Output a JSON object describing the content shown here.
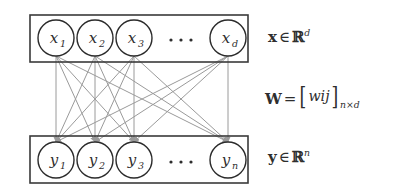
{
  "figure": {
    "type": "bipartite-network-diagram",
    "background_color": "#ffffff",
    "box_stroke_color": "#3a3a3a",
    "node_stroke_color": "#2b2b2b",
    "edge_color": "#9a9a9a",
    "text_color": "#2e2e2e"
  },
  "input_layer": {
    "name": "input-layer",
    "box": {
      "x": 30,
      "y": 15,
      "width": 218,
      "height": 47
    },
    "nodes": [
      {
        "id": "x1",
        "base": "x",
        "subscript": "1",
        "cx": 56,
        "cy": 38,
        "r": 18
      },
      {
        "id": "x2",
        "base": "x",
        "subscript": "2",
        "cx": 95,
        "cy": 38,
        "r": 18
      },
      {
        "id": "x3",
        "base": "x",
        "subscript": "3",
        "cx": 134,
        "cy": 38,
        "r": 18
      },
      {
        "id": "xd",
        "base": "x",
        "subscript": "d",
        "cx": 228,
        "cy": 38,
        "r": 18
      }
    ],
    "ellipsis": {
      "cx": 181,
      "cy": 40,
      "dots": 3,
      "dot_spacing": 10,
      "dot_radius": 1.6
    }
  },
  "output_layer": {
    "name": "output-layer",
    "box": {
      "x": 30,
      "y": 136,
      "width": 218,
      "height": 47
    },
    "nodes": [
      {
        "id": "y1",
        "base": "y",
        "subscript": "1",
        "cx": 56,
        "cy": 160,
        "r": 18
      },
      {
        "id": "y2",
        "base": "y",
        "subscript": "2",
        "cx": 95,
        "cy": 160,
        "r": 18
      },
      {
        "id": "y3",
        "base": "y",
        "subscript": "3",
        "cx": 134,
        "cy": 160,
        "r": 18
      },
      {
        "id": "yn",
        "base": "y",
        "subscript": "n",
        "cx": 228,
        "cy": 160,
        "r": 18
      }
    ],
    "ellipsis": {
      "cx": 181,
      "cy": 162,
      "dots": 3,
      "dot_spacing": 10,
      "dot_radius": 1.6
    }
  },
  "edges": {
    "name": "weight-edges",
    "description": "fully connected directed edges from every input node to every output node",
    "count": 16,
    "directed": true,
    "arrowhead": "filled-triangle",
    "color": "#9a9a9a",
    "stroke_width": 1,
    "source_y": 56,
    "target_y": 142,
    "sources_x": [
      56,
      95,
      134,
      228
    ],
    "targets_x": [
      56,
      95,
      134,
      228
    ]
  },
  "labels": {
    "input": {
      "id": "label-x",
      "text": "x ∈ ℝ^d",
      "vector": "x",
      "relation": "∈",
      "set": "ℝ",
      "exponent": "d"
    },
    "weights": {
      "id": "label-w",
      "text": "W = [w_ij]_{n×d}",
      "matrix": "W",
      "relation": "=",
      "entry": "w",
      "entry_subscript": "ij",
      "dimensions": "n×d"
    },
    "output": {
      "id": "label-y",
      "text": "y ∈ ℝ^n",
      "vector": "y",
      "relation": "∈",
      "set": "ℝ",
      "exponent": "n"
    }
  }
}
